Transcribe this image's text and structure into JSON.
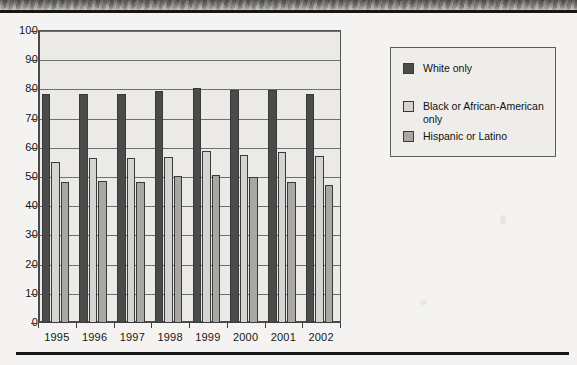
{
  "chart_data": {
    "type": "bar",
    "title": "",
    "subtitle": "",
    "xlabel": "",
    "ylabel": "",
    "ylim": [
      0,
      100
    ],
    "yticks": [
      0,
      10,
      20,
      30,
      40,
      50,
      60,
      70,
      80,
      90,
      100
    ],
    "grid": true,
    "legend_position": "right",
    "categories": [
      "1995",
      "1996",
      "1997",
      "1998",
      "1999",
      "2000",
      "2001",
      "2002"
    ],
    "series": [
      {
        "name": "White only",
        "color": "#4b4b4b",
        "values": [
          78.5,
          78.5,
          78.3,
          79.6,
          80.4,
          79.8,
          79.7,
          78.3
        ]
      },
      {
        "name": "Black or African-American only",
        "color": "#d6d4d1",
        "values": [
          55.3,
          56.5,
          56.6,
          56.7,
          58.8,
          57.6,
          58.4,
          57.2
        ]
      },
      {
        "name": "Hispanic or Latino",
        "color": "#a9a7a4",
        "values": [
          48.4,
          48.5,
          48.2,
          50.3,
          50.7,
          49.9,
          48.4,
          47.1
        ]
      }
    ]
  },
  "legend": {
    "items": [
      {
        "label": "White only",
        "swatch": "s0"
      },
      {
        "label": "Black or African-American only",
        "swatch": "s1"
      },
      {
        "label": "Hispanic or Latino",
        "swatch": "s2"
      }
    ]
  },
  "page": {
    "scan_band_name": "scanned-page-edge",
    "rule_top_name": "horizontal-rule-top",
    "rule_bottom_name": "horizontal-rule-bottom"
  }
}
